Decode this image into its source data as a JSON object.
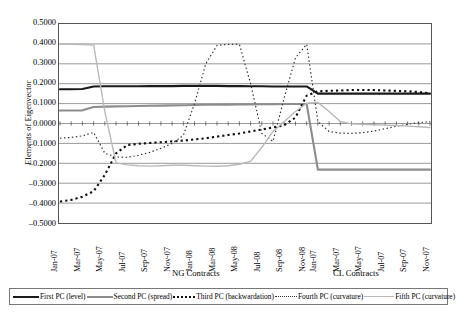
{
  "chart_data": {
    "type": "line",
    "title": "",
    "xlabel": "",
    "ylabel": "Elements of Eigenvector",
    "ylim": [
      -0.5,
      0.5
    ],
    "grid": true,
    "legend_position": "bottom",
    "group_labels": [
      {
        "label": "NG Contracts",
        "start_index": 0,
        "end_index": 22
      },
      {
        "label": "CL Contracts",
        "start_index": 23,
        "end_index": 33
      }
    ],
    "ytick_labels": [
      "0.5000",
      "0.4000",
      "0.3000",
      "0.2000",
      "0.1000",
      "0.0000",
      "-0.1000",
      "-0.2000",
      "-0.3000",
      "-0.4000",
      "-0.5000"
    ],
    "ytick_values": [
      0.5,
      0.4,
      0.3,
      0.2,
      0.1,
      0.0,
      -0.1,
      -0.2,
      -0.3,
      -0.4,
      -0.5
    ],
    "x": [
      "Jan-07",
      "Feb-07",
      "Mar-07",
      "Apr-07",
      "May-07",
      "Jun-07",
      "Jul-07",
      "Aug-07",
      "Sep-07",
      "Oct-07",
      "Nov-07",
      "Dec-07",
      "Jan-08",
      "Feb-08",
      "Mar-08",
      "Apr-08",
      "May-08",
      "Jun-08",
      "Jul-08",
      "Aug-08",
      "Sep-08",
      "Oct-08",
      "Nov-08",
      "Jan-07 ",
      "Feb-07 ",
      "Mar-07 ",
      "Apr-07 ",
      "May-07 ",
      "Jun-07 ",
      "Jul-07 ",
      "Aug-07 ",
      "Sep-07 ",
      "Oct-07 ",
      "Nov-07 "
    ],
    "xtick_labels": [
      "Jan-07",
      "Mar-07",
      "May-07",
      "Jul-07",
      "Sep-07",
      "Nov-07",
      "Jan-08",
      "Mar-08",
      "May-08",
      "Jul-08",
      "Sep-08",
      "Nov-08",
      "Jan-07",
      "Mar-07",
      "May-07",
      "Jul-07",
      "Sep-07",
      "Nov-07"
    ],
    "xtick_indices": [
      0,
      2,
      4,
      6,
      8,
      10,
      12,
      14,
      16,
      18,
      20,
      22,
      23,
      25,
      27,
      29,
      31,
      33
    ],
    "series": [
      {
        "name": "First PC (level)",
        "style": "solid",
        "color": "#1a1a1a",
        "width": 2.1,
        "values": [
          0.172,
          0.172,
          0.173,
          0.186,
          0.187,
          0.187,
          0.187,
          0.187,
          0.188,
          0.188,
          0.188,
          0.189,
          0.189,
          0.189,
          0.189,
          0.188,
          0.188,
          0.187,
          0.187,
          0.186,
          0.186,
          0.186,
          0.186,
          0.15,
          0.15,
          0.15,
          0.15,
          0.15,
          0.15,
          0.15,
          0.15,
          0.15,
          0.15,
          0.15
        ]
      },
      {
        "name": "Second PC (spread)",
        "style": "solid",
        "color": "#8d8d8d",
        "width": 2.1,
        "values": [
          0.065,
          0.065,
          0.066,
          0.083,
          0.085,
          0.086,
          0.087,
          0.088,
          0.089,
          0.09,
          0.091,
          0.092,
          0.093,
          0.094,
          0.094,
          0.095,
          0.096,
          0.096,
          0.097,
          0.097,
          0.098,
          0.098,
          0.098,
          -0.232,
          -0.232,
          -0.232,
          -0.232,
          -0.232,
          -0.232,
          -0.232,
          -0.232,
          -0.232,
          -0.232,
          -0.232
        ]
      },
      {
        "name": "Third PC (backwardation)",
        "style": "dotted-bold",
        "color": "#111111",
        "width": 2.1,
        "values": [
          -0.392,
          -0.384,
          -0.368,
          -0.34,
          -0.258,
          -0.15,
          -0.108,
          -0.102,
          -0.098,
          -0.094,
          -0.09,
          -0.086,
          -0.08,
          -0.074,
          -0.066,
          -0.058,
          -0.05,
          -0.04,
          -0.03,
          -0.02,
          -0.009,
          0.03,
          0.14,
          0.162,
          0.164,
          0.166,
          0.168,
          0.168,
          0.168,
          0.166,
          0.164,
          0.162,
          0.158,
          0.152
        ]
      },
      {
        "name": "Fourth PC (curvature)",
        "style": "dotted-fine",
        "color": "#333333",
        "width": 1.2,
        "values": [
          -0.074,
          -0.07,
          -0.062,
          -0.045,
          -0.15,
          -0.168,
          -0.17,
          -0.16,
          -0.145,
          -0.125,
          -0.1,
          -0.06,
          0.1,
          0.3,
          0.392,
          0.398,
          0.398,
          0.2,
          -0.05,
          -0.09,
          0.13,
          0.33,
          0.398,
          0.01,
          -0.04,
          -0.048,
          -0.05,
          -0.046,
          -0.038,
          -0.026,
          -0.014,
          -0.004,
          0.004,
          0.01
        ]
      },
      {
        "name": "Fifth PC (curvature)",
        "style": "solid-light",
        "color": "#b9b9b9",
        "width": 1.4,
        "values": [
          0.398,
          0.398,
          0.397,
          0.394,
          0.06,
          -0.198,
          -0.208,
          -0.212,
          -0.214,
          -0.212,
          -0.21,
          -0.21,
          -0.212,
          -0.214,
          -0.215,
          -0.212,
          -0.205,
          -0.19,
          -0.12,
          -0.04,
          0.01,
          0.06,
          0.102,
          0.106,
          0.06,
          0.01,
          -0.002,
          -0.004,
          -0.006,
          -0.008,
          -0.01,
          -0.013,
          -0.016,
          -0.02
        ]
      }
    ]
  },
  "legend": {
    "items": [
      {
        "label": "First PC (level)",
        "swatch": "sw-solid-dark"
      },
      {
        "label": "Second PC (spread)",
        "swatch": "sw-solid-gray"
      },
      {
        "label": "Third PC (backwardation)",
        "swatch": "sw-dash-bold"
      },
      {
        "label": "Fourth PC (curvature)",
        "swatch": "sw-dash-fine"
      },
      {
        "label": "Fifth PC (curvature)",
        "swatch": "sw-solid-light"
      }
    ]
  }
}
